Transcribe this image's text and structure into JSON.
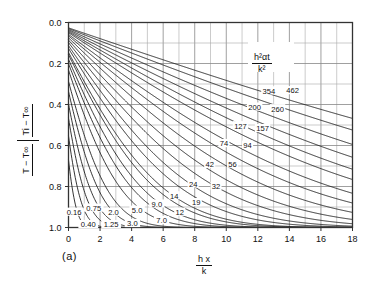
{
  "figure": {
    "panel_label": "(a)",
    "key_label": {
      "numerator": "h²αt",
      "denominator": "k²"
    },
    "x_axis_label": {
      "numerator": "h x",
      "denominator": "k"
    },
    "y_axis_label": {
      "numerator": "T − T∞",
      "denominator": "Ti − T∞"
    }
  },
  "chart_data": {
    "type": "line",
    "title": "",
    "subtitle": "",
    "xlabel": "hx/k",
    "ylabel": "(T - T∞)/(Ti - T∞)",
    "xlim": [
      0,
      18
    ],
    "ylim": [
      0,
      1
    ],
    "y_inverted": true,
    "grid": true,
    "grid_x_step": 1,
    "grid_y_step": 0.1,
    "legend_position": "inline-curve-labels",
    "legend_title": "h²αt/k²",
    "x_ticks": [
      0,
      2,
      4,
      6,
      8,
      10,
      12,
      14,
      16,
      18
    ],
    "x_tick_labels": [
      "0",
      "2",
      "4",
      "6",
      "8",
      "10",
      "12",
      "14",
      "16",
      "18"
    ],
    "y_ticks": [
      0.0,
      0.2,
      0.4,
      0.6,
      0.8,
      1.0
    ],
    "y_tick_labels": [
      "0.0",
      "0.2",
      "0.4",
      "0.6",
      "0.8",
      "1.0"
    ],
    "series": [
      {
        "name": "0.16",
        "value": 0.16,
        "label": "0.16",
        "label_x": 0.35,
        "label_y": 0.925
      },
      {
        "name": "0.40",
        "value": 0.4,
        "label": "0.40",
        "label_x": 1.25,
        "label_y": 0.985
      },
      {
        "name": "0.75",
        "value": 0.75,
        "label": "0.75",
        "label_x": 1.6,
        "label_y": 0.905
      },
      {
        "name": "1.25",
        "value": 1.25,
        "label": "1.25",
        "label_x": 2.7,
        "label_y": 0.985
      },
      {
        "name": "2.0",
        "value": 2.0,
        "label": "2.0",
        "label_x": 2.85,
        "label_y": 0.925
      },
      {
        "name": "3.0",
        "value": 3.0,
        "label": "3.0",
        "label_x": 4.05,
        "label_y": 0.98
      },
      {
        "name": "5.0",
        "value": 5.0,
        "label": "5.0",
        "label_x": 4.35,
        "label_y": 0.915
      },
      {
        "name": "7.0",
        "value": 7.0,
        "label": "7.0",
        "label_x": 5.9,
        "label_y": 0.965
      },
      {
        "name": "9.0",
        "value": 9.0,
        "label": "9.0",
        "label_x": 5.6,
        "label_y": 0.885
      },
      {
        "name": "12",
        "value": 12,
        "label": "12",
        "label_x": 7.05,
        "label_y": 0.925
      },
      {
        "name": "14",
        "value": 14,
        "label": "14",
        "label_x": 6.7,
        "label_y": 0.845
      },
      {
        "name": "19",
        "value": 19,
        "label": "19",
        "label_x": 8.1,
        "label_y": 0.878
      },
      {
        "name": "24",
        "value": 24,
        "label": "24",
        "label_x": 7.9,
        "label_y": 0.787
      },
      {
        "name": "32",
        "value": 32,
        "label": "32",
        "label_x": 9.35,
        "label_y": 0.8
      },
      {
        "name": "42",
        "value": 42,
        "label": "42",
        "label_x": 8.95,
        "label_y": 0.692
      },
      {
        "name": "56",
        "value": 56,
        "label": "56",
        "label_x": 10.4,
        "label_y": 0.69
      },
      {
        "name": "74",
        "value": 74,
        "label": "74",
        "label_x": 9.85,
        "label_y": 0.59
      },
      {
        "name": "94",
        "value": 94,
        "label": "94",
        "label_x": 11.35,
        "label_y": 0.598
      },
      {
        "name": "127",
        "value": 127,
        "label": "127",
        "label_x": 10.9,
        "label_y": 0.503
      },
      {
        "name": "157",
        "value": 157,
        "label": "157",
        "label_x": 12.3,
        "label_y": 0.517
      },
      {
        "name": "200",
        "value": 200,
        "label": "200",
        "label_x": 11.8,
        "label_y": 0.412
      },
      {
        "name": "260",
        "value": 260,
        "label": "260",
        "label_x": 13.25,
        "label_y": 0.42
      },
      {
        "name": "354",
        "value": 354,
        "label": "354",
        "label_x": 12.7,
        "label_y": 0.333
      },
      {
        "name": "462",
        "value": 462,
        "label": "462",
        "label_x": 14.2,
        "label_y": 0.332
      }
    ]
  }
}
